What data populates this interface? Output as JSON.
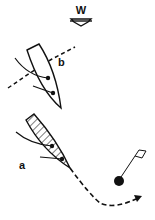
{
  "diagram": {
    "type": "sailing-rules-diagram",
    "wind": {
      "label": "W",
      "direction": "down"
    },
    "boats": [
      {
        "id": "b",
        "label": "b",
        "fill": "none",
        "track": "dashed line crossing ahead"
      },
      {
        "id": "a",
        "label": "a",
        "fill": "hatched",
        "track": "dashed curve rounding mark"
      }
    ],
    "mark": {
      "type": "buoy-with-flag",
      "color": "#111111"
    },
    "colors": {
      "ink": "#111111",
      "background": "#ffffff"
    }
  }
}
